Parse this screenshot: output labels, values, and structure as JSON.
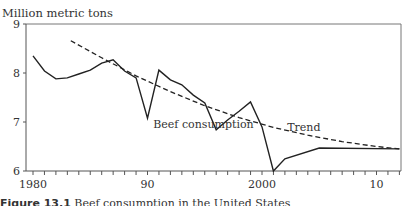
{
  "chart_data": {
    "type": "line",
    "title": "",
    "ylabel": "Million metric tons",
    "xlabel": "",
    "xlim": [
      1979.4,
      2012.5
    ],
    "ylim": [
      6,
      9
    ],
    "x_ticks": [
      1980,
      1981,
      1982,
      1983,
      1984,
      1985,
      1986,
      1987,
      1988,
      1989,
      1990,
      1991,
      1992,
      1993,
      1994,
      1995,
      1996,
      1997,
      1998,
      1999,
      2000,
      2001,
      2002,
      2003,
      2004,
      2005,
      2006,
      2007,
      2008,
      2009,
      2010,
      2011,
      2012
    ],
    "x_tick_labels": [
      {
        "value": 1980,
        "label": "1980"
      },
      {
        "value": 1990,
        "label": "90"
      },
      {
        "value": 2000,
        "label": "2000"
      },
      {
        "value": 2010,
        "label": "10"
      }
    ],
    "y_tick_labels": [
      {
        "value": 6,
        "label": "6"
      },
      {
        "value": 7,
        "label": "7"
      },
      {
        "value": 8,
        "label": "8"
      },
      {
        "value": 9,
        "label": "9"
      }
    ],
    "grid": false,
    "series": [
      {
        "name": "Beef consumption",
        "style": "solid",
        "color": "#222222",
        "x": [
          1980,
          1981,
          1982,
          1983,
          1984,
          1985,
          1986,
          1987,
          1988,
          1989,
          1990,
          1991,
          1992,
          1993,
          1994,
          1995,
          1996,
          1997,
          1998,
          1999,
          2000,
          2001,
          2002,
          2005,
          2012
        ],
        "values": [
          8.35,
          8.04,
          7.88,
          7.9,
          7.98,
          8.06,
          8.2,
          8.27,
          8.04,
          7.9,
          7.08,
          8.06,
          7.86,
          7.76,
          7.55,
          7.39,
          6.84,
          7.04,
          7.22,
          7.41,
          6.9,
          6.0,
          6.25,
          6.47,
          6.45
        ]
      },
      {
        "name": "Trend",
        "style": "dashed",
        "color": "#222222",
        "x": [
          1983.3,
          1986,
          1989,
          1992,
          1995,
          1998,
          2001,
          2004,
          2007,
          2010,
          2012
        ],
        "values": [
          8.66,
          8.31,
          7.94,
          7.62,
          7.33,
          7.09,
          6.89,
          6.73,
          6.6,
          6.5,
          6.45
        ]
      }
    ],
    "annotations": [
      {
        "text": "Beef consumption",
        "x": 1990.5,
        "y": 6.95
      },
      {
        "text": "Trend",
        "x": 2002.2,
        "y": 6.9
      }
    ]
  },
  "caption": {
    "number": "Figure 13.1",
    "text": "Beef consumption in the United States"
  }
}
